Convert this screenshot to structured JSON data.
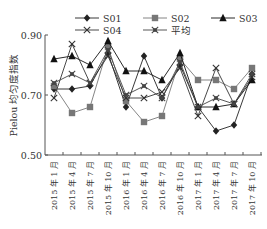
{
  "chart_data": {
    "type": "line",
    "title": "",
    "xlabel": "",
    "ylabel": "Pielou 均匀度指数",
    "ylim": [
      0.5,
      0.9
    ],
    "yticks": [
      "0.50",
      "0.70",
      "0.90"
    ],
    "grid": false,
    "legend_position": "top",
    "categories": [
      "2015 年 1 月",
      "2015 年 4 月",
      "2015 年 7 月",
      "2015 年 10 月",
      "2016 年 1 月",
      "2016 年 4 月",
      "2016 年 7 月",
      "2016 年 10 月",
      "2017 年 1 月",
      "2017 年 4 月",
      "2017 年 7 月",
      "2017 年 10 月"
    ],
    "series": [
      {
        "name": "S01",
        "marker": "diamond",
        "color": "#222222",
        "values": [
          0.72,
          0.72,
          0.73,
          0.84,
          0.66,
          0.83,
          0.69,
          0.8,
          0.66,
          0.58,
          0.6,
          0.77
        ]
      },
      {
        "name": "S02",
        "marker": "square",
        "color": "#777777",
        "values": [
          0.73,
          0.64,
          0.66,
          0.86,
          0.68,
          0.61,
          0.63,
          0.82,
          0.75,
          0.75,
          0.72,
          0.79
        ]
      },
      {
        "name": "S03",
        "marker": "triangle",
        "color": "#111111",
        "values": [
          0.82,
          0.83,
          0.8,
          0.88,
          0.78,
          0.78,
          0.75,
          0.84,
          0.66,
          0.66,
          0.67,
          0.75
        ]
      },
      {
        "name": "S04",
        "marker": "x",
        "color": "#333333",
        "values": [
          0.69,
          0.87,
          0.74,
          0.83,
          0.69,
          0.69,
          0.71,
          0.79,
          0.63,
          0.79,
          0.67,
          0.76
        ]
      },
      {
        "name": "平均",
        "marker": "star",
        "color": "#444444",
        "values": [
          0.74,
          0.77,
          0.74,
          0.85,
          0.7,
          0.73,
          0.69,
          0.81,
          0.66,
          0.69,
          0.67,
          0.77
        ]
      }
    ]
  }
}
